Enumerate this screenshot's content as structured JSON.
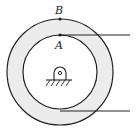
{
  "diagram": {
    "labels": {
      "point_b": "B",
      "point_a": "A"
    },
    "colors": {
      "stroke": "#222222",
      "ring_fill": "#ececec",
      "background": "#ffffff"
    },
    "elements": {
      "outer_circle": "outer-wheel",
      "inner_circle": "inner-wheel",
      "support": "fixed-pin-support",
      "upper_line": "upper-tangent-rope",
      "lower_line": "lower-tangent-rope"
    }
  }
}
